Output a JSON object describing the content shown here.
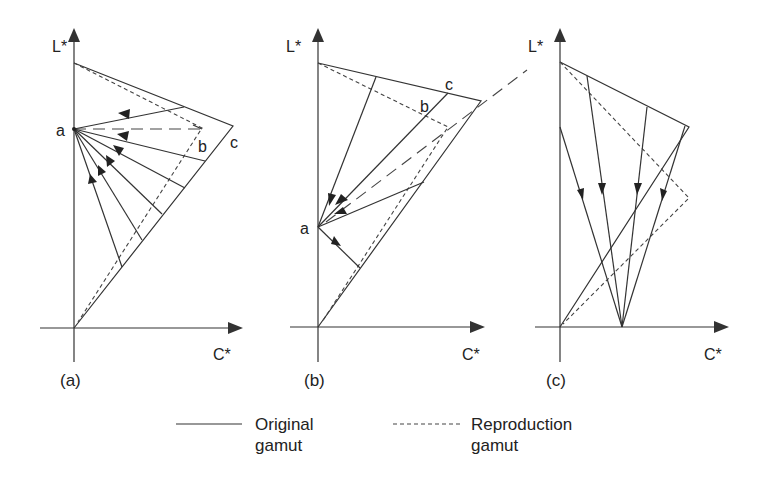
{
  "figure": {
    "panels": [
      {
        "id": "a",
        "caption": "(a)",
        "y_axis_label": "L*",
        "x_axis_label": "C*",
        "point_labels": {
          "a": "a",
          "b": "b",
          "c": "c"
        },
        "description": "Lightness-preserving toward point a on L* axis; colors mapped toward a single focal point"
      },
      {
        "id": "b",
        "caption": "(b)",
        "y_axis_label": "L*",
        "x_axis_label": "C*",
        "point_labels": {
          "a": "a",
          "b": "b",
          "c": "c"
        },
        "description": "Mapping toward focal point a at lower lightness"
      },
      {
        "id": "c",
        "caption": "(c)",
        "y_axis_label": "L*",
        "x_axis_label": "C*",
        "description": "Mapping toward focal point on C* axis"
      }
    ],
    "legend": {
      "items": [
        {
          "style": "solid",
          "line1": "Original",
          "line2": "gamut"
        },
        {
          "style": "dashed",
          "line1": "Reproduction",
          "line2": "gamut"
        }
      ]
    },
    "colors": {
      "ink": "#333333",
      "background": "#ffffff"
    }
  }
}
